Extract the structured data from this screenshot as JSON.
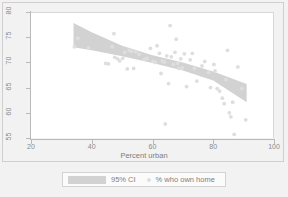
{
  "chart_data": {
    "type": "scatter",
    "title": "",
    "subtitle": "",
    "xlabel": "Percent urban",
    "ylabel": "",
    "xlim": [
      20,
      100
    ],
    "ylim": [
      55,
      80
    ],
    "xticks": [
      20,
      40,
      60,
      80,
      100
    ],
    "yticks": [
      55,
      60,
      65,
      70,
      75,
      80
    ],
    "grid": false,
    "legend_position": "below-plot",
    "legend": [
      {
        "label": "95% CI",
        "marker": "band",
        "color": "#d2d2d2"
      },
      {
        "label": "% who own home",
        "marker": "circle",
        "color": "#dedede"
      }
    ],
    "series": [
      {
        "name": "% who own home",
        "type": "scatter",
        "marker": "circle",
        "color": "#dedede",
        "points": [
          [
            35.4,
            75.0
          ],
          [
            34.3,
            73.3
          ],
          [
            38.9,
            73.1
          ],
          [
            44.6,
            70.0
          ],
          [
            45.5,
            69.9
          ],
          [
            46.7,
            73.3
          ],
          [
            47.3,
            75.9
          ],
          [
            47.6,
            71.2
          ],
          [
            48.5,
            70.9
          ],
          [
            49.2,
            70.5
          ],
          [
            50.2,
            71.0
          ],
          [
            50.8,
            72.2
          ],
          [
            51.7,
            68.9
          ],
          [
            52.3,
            72.6
          ],
          [
            53.1,
            72.4
          ],
          [
            53.8,
            69.0
          ],
          [
            54.5,
            72.3
          ],
          [
            55.6,
            71.8
          ],
          [
            57.3,
            70.8
          ],
          [
            58.2,
            71.0
          ],
          [
            59.3,
            73.0
          ],
          [
            60.2,
            70.4
          ],
          [
            60.9,
            70.2
          ],
          [
            61.5,
            73.5
          ],
          [
            62.3,
            72.0
          ],
          [
            62.8,
            68.0
          ],
          [
            63.2,
            70.5
          ],
          [
            63.9,
            70.3
          ],
          [
            64.2,
            58.0
          ],
          [
            64.7,
            71.5
          ],
          [
            65.3,
            66.0
          ],
          [
            65.8,
            77.5
          ],
          [
            66.2,
            71.3
          ],
          [
            66.9,
            69.8
          ],
          [
            67.4,
            72.2
          ],
          [
            67.8,
            74.8
          ],
          [
            68.3,
            70.0
          ],
          [
            68.7,
            69.0
          ],
          [
            69.3,
            70.9
          ],
          [
            69.8,
            69.1
          ],
          [
            70.5,
            71.9
          ],
          [
            71.2,
            65.4
          ],
          [
            72.4,
            70.7
          ],
          [
            73.1,
            72.0
          ],
          [
            73.8,
            69.0
          ],
          [
            74.6,
            66.5
          ],
          [
            76.3,
            69.5
          ],
          [
            77.2,
            70.4
          ],
          [
            78.5,
            68.2
          ],
          [
            79.1,
            65.2
          ],
          [
            80.2,
            69.8
          ],
          [
            80.6,
            68.5
          ],
          [
            81.3,
            65.0
          ],
          [
            82.1,
            64.5
          ],
          [
            83.0,
            63.1
          ],
          [
            83.6,
            62.0
          ],
          [
            84.2,
            66.8
          ],
          [
            84.7,
            72.6
          ],
          [
            85.3,
            60.2
          ],
          [
            85.8,
            59.4
          ],
          [
            86.4,
            62.3
          ],
          [
            86.9,
            55.9
          ],
          [
            88.1,
            69.3
          ],
          [
            89.4,
            65.0
          ],
          [
            90.7,
            58.8
          ]
        ]
      },
      {
        "name": "95% CI",
        "type": "band",
        "color": "#d2d2d2",
        "x": [
          34.0,
          40.0,
          50.0,
          60.0,
          70.0,
          80.0,
          91.0
        ],
        "lower": [
          73.2,
          72.6,
          71.4,
          70.1,
          68.6,
          66.6,
          62.3
        ],
        "upper": [
          78.0,
          76.2,
          73.5,
          71.6,
          70.2,
          68.4,
          65.9
        ]
      }
    ]
  },
  "axis": {
    "x_title": "Percent urban",
    "x_tick_labels": [
      "20",
      "40",
      "60",
      "80",
      "100"
    ],
    "y_tick_labels": [
      "55",
      "60",
      "65",
      "70",
      "75",
      "80"
    ]
  },
  "legend": {
    "ci_label": "95% CI",
    "points_label": "% who own home"
  },
  "colors": {
    "band": "#d2d2d2",
    "point": "#dedede",
    "axis": "#b9b9b9",
    "text": "#8a8a8a",
    "page_background": "#f2f2f2",
    "plot_background": "#ffffff"
  }
}
